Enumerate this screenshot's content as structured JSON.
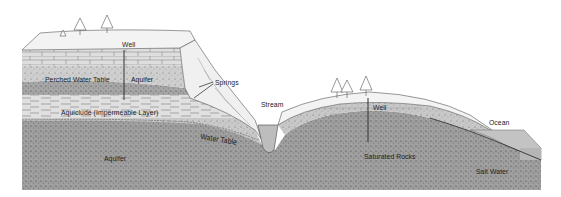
{
  "diagram": {
    "type": "geologic-cross-section",
    "labels": {
      "well_left": "Well",
      "springs": "Springs",
      "perched_water_table": "Perched Water Table",
      "aquifer_upper": "Aquifer",
      "aquiclude": "Aquiclude (Impermeable Layer)",
      "stream": "Stream",
      "water_table": "Water Table",
      "aquifer_lower": "Aquifer",
      "well_right": "Well",
      "saturated_rocks": "Saturated Rocks",
      "ocean": "Ocean",
      "salt_water": "Salt Water"
    },
    "colors": {
      "background": "#ffffff",
      "surface_rock": "#f2f2f2",
      "limestone": "#d9d9d9",
      "perched_sand": "#c8c8c8",
      "dark_aquifer": "#a4a4a4",
      "aquiclude": "#dcdcdc",
      "lower_aquifer": "#9c9c9c",
      "unsaturated_zone": "#c6c6c6",
      "ocean": "#c4c4c4",
      "line": "#333333"
    }
  }
}
